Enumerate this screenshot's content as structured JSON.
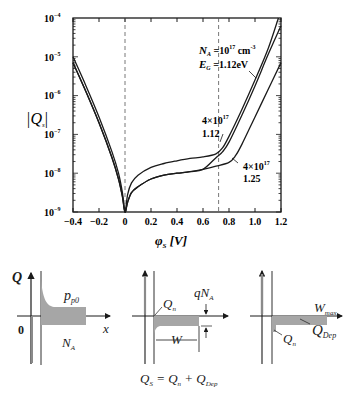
{
  "chart_data": {
    "type": "line",
    "xlabel": "φS [V]",
    "ylabel": "|Qs|",
    "xlim": [
      -0.4,
      1.2
    ],
    "ylim_log10": [
      -9,
      -4
    ],
    "yscale": "log",
    "x_ticks": [
      "−0.4",
      "−0.2",
      "0",
      "0.2",
      "0.4",
      "0.6",
      "0.8",
      "1.0",
      "1.2"
    ],
    "y_ticks": [
      "10^-4",
      "10^-5",
      "10^-6",
      "10^-7",
      "10^-8",
      "10^-9"
    ],
    "reference_lines_x": [
      0,
      0.72
    ],
    "grid": false,
    "series": [
      {
        "name": "NA=10^17 cm^-3, EG=1.12eV",
        "x": [
          -0.4,
          -0.3,
          -0.2,
          -0.1,
          -0.05,
          -0.02,
          0.0,
          0.02,
          0.05,
          0.1,
          0.2,
          0.3,
          0.4,
          0.5,
          0.6,
          0.7,
          0.75,
          0.8,
          0.9,
          1.0,
          1.1,
          1.18
        ],
        "log10": [
          -5.0,
          -5.75,
          -6.55,
          -7.45,
          -8.0,
          -8.5,
          -9.0,
          -8.55,
          -8.25,
          -8.05,
          -7.85,
          -7.75,
          -7.68,
          -7.62,
          -7.58,
          -7.5,
          -7.35,
          -7.05,
          -6.35,
          -5.6,
          -4.8,
          -4.0
        ]
      },
      {
        "name": "4×10^17, 1.12",
        "x": [
          -0.4,
          -0.3,
          -0.2,
          -0.1,
          -0.05,
          -0.02,
          0.0,
          0.02,
          0.05,
          0.1,
          0.2,
          0.3,
          0.4,
          0.5,
          0.6,
          0.7,
          0.75,
          0.8,
          0.9,
          1.0,
          1.1,
          1.2
        ],
        "log10": [
          -5.15,
          -5.9,
          -6.7,
          -7.6,
          -8.15,
          -8.6,
          -9.0,
          -8.75,
          -8.5,
          -8.35,
          -8.15,
          -8.05,
          -8.0,
          -7.96,
          -7.9,
          -7.6,
          -7.45,
          -7.2,
          -6.5,
          -5.75,
          -4.95,
          -4.2
        ]
      },
      {
        "name": "4×10^17, 1.25",
        "x": [
          -0.4,
          -0.3,
          -0.2,
          -0.1,
          -0.05,
          -0.02,
          0.0,
          0.02,
          0.05,
          0.1,
          0.2,
          0.3,
          0.4,
          0.5,
          0.6,
          0.7,
          0.8,
          0.85,
          0.9,
          1.0,
          1.1,
          1.2
        ],
        "log10": [
          -5.15,
          -5.9,
          -6.7,
          -7.6,
          -8.15,
          -8.6,
          -9.0,
          -8.75,
          -8.5,
          -8.35,
          -8.15,
          -8.05,
          -8.0,
          -7.96,
          -7.9,
          -7.82,
          -7.72,
          -7.55,
          -7.25,
          -6.55,
          -5.85,
          -5.15
        ]
      }
    ],
    "annotations": [
      {
        "text": "NA =10^17 cm^-3",
        "x": 0.8,
        "log10": -4.95
      },
      {
        "text": "EG =1.12eV",
        "x": 0.8,
        "log10": -5.35
      },
      {
        "text": "4×10^17",
        "x": 0.63,
        "log10": -6.85
      },
      {
        "text": "1.12",
        "x": 0.63,
        "log10": -7.2
      },
      {
        "text": "4×10^17",
        "x": 0.93,
        "log10": -7.8
      },
      {
        "text": "1.25",
        "x": 0.93,
        "log10": -8.15
      }
    ]
  },
  "plot": {
    "ylabel_main": "|Q",
    "ylabel_sub": "s",
    "ylabel_end": "|",
    "xlabel_main": "φ",
    "xlabel_sub": "S",
    "xlabel_unit": " [V]",
    "y_tick_base": "10",
    "y_tick_exps": [
      "−4",
      "−5",
      "−6",
      "−7",
      "−8",
      "−9"
    ],
    "x_tick_labels": [
      "−0.4",
      "−0.2",
      "0",
      "0.2",
      "0.4",
      "0.6",
      "0.8",
      "1.0",
      "1.2"
    ],
    "ann1_a": "N",
    "ann1_a_sub": "A",
    "ann1_b": " =10",
    "ann1_b_sup": "17",
    "ann1_c": " cm",
    "ann1_c_sup": "-3",
    "ann2_a": "E",
    "ann2_a_sub": "G",
    "ann2_b": " =1.12eV",
    "ann3_a": "4×10",
    "ann3_sup": "17",
    "ann3_b": "1.12",
    "ann4_a": "4×10",
    "ann4_sup": "17",
    "ann4_b": "1.25"
  },
  "diagrams": {
    "d1": {
      "axis_y": "Q",
      "origin": "0",
      "axis_x": "x",
      "upper": "p",
      "upper_sub": "p0",
      "lower": "N",
      "lower_sub": "A"
    },
    "d2": {
      "qna": "qN",
      "qna_sub": "A",
      "qn": "Q",
      "qn_sub": "n",
      "w": "W"
    },
    "d3": {
      "wmax": "W",
      "wmax_sub": "max",
      "qn": "Q",
      "qn_sub": "n",
      "qdep": "Q",
      "qdep_sub": "Dep"
    },
    "equation": {
      "a": "Q",
      "a_sub": "S",
      "eq": " = ",
      "b": "Q",
      "b_sub": "n",
      "plus": " + ",
      "c": "Q",
      "c_sub": "Dep"
    }
  }
}
